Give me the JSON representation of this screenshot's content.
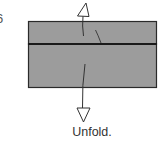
{
  "diagram": {
    "step_number": "6",
    "caption": "Unfold.",
    "paper": {
      "fill": "#9c9c9c",
      "edge": "#2a2a2a",
      "fold_line": "#1a1a1a"
    },
    "arrows": [
      {
        "name": "unfold-up-arrow",
        "direction": "up"
      },
      {
        "name": "unfold-down-arrow",
        "direction": "down"
      }
    ]
  }
}
